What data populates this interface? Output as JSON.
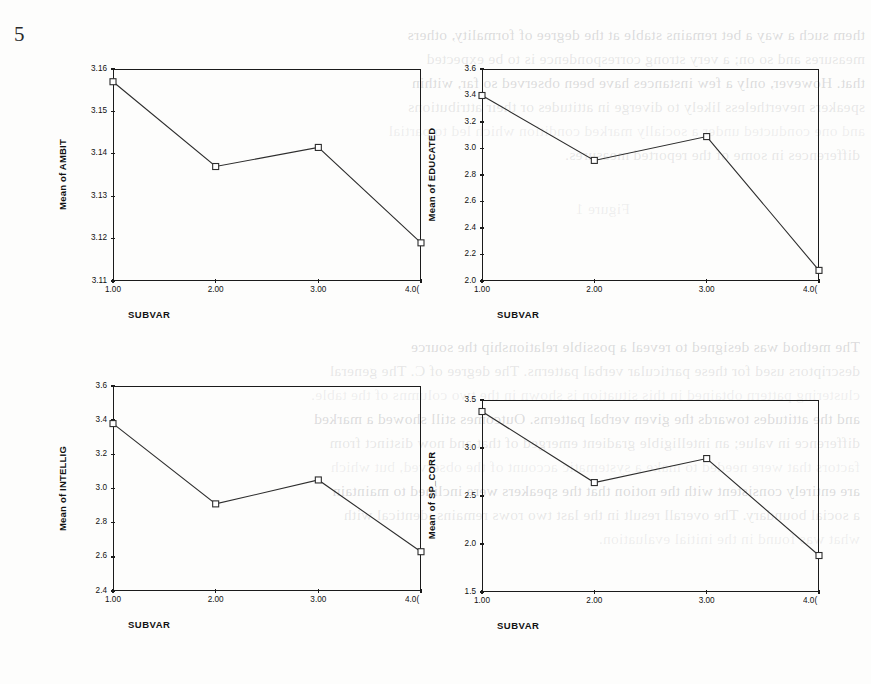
{
  "page": {
    "number": "5",
    "bleed_through_lines": [
      "them such a way a bet remains stable at the degree of formality, others",
      "measures and so on; a very strong correspondence is to be expected",
      "that. However, only a few instances have been observed so far, within",
      "speakers nevertheless likely to diverge in attitudes or their attributions",
      "and one conducted under a socially marked condition which led to partial",
      "differences in some of the reported measures.",
      "Figure 1",
      "The method was designed to reveal a possible relationship the source",
      "descriptors used for these particular verbal patterns. The degree of C. The general",
      "clustering pattern obtained in this situation is shown in the two columns of the table.",
      "and the attitudes towards the given verbal patterns. Outcomes still showed a marked",
      "difference in value; an intelligible gradient emerged of that and now distinct from",
      "factors that were needed to make a systematic account of the observed, but which",
      "are entirely consistent with the notion that the speakers were inclined to maintain",
      "a social boundary. The overall result in the last two rows remains identical with",
      "what was found in the initial evaluation."
    ]
  },
  "chart_data": [
    {
      "id": "ambit",
      "type": "line",
      "title": "",
      "ylabel": "Mean of AMBIT",
      "xlabel": "SUBVAR",
      "categories": [
        "1.00",
        "2.00",
        "3.00",
        "4.00"
      ],
      "x": [
        1,
        2,
        3,
        4
      ],
      "values": [
        3.157,
        3.137,
        3.1415,
        3.119
      ],
      "ylim": [
        3.11,
        3.16
      ],
      "ytick_values": [
        3.11,
        3.12,
        3.13,
        3.14,
        3.15,
        3.16
      ],
      "ytick_labels": [
        "3.11",
        "3.12",
        "3.13",
        "3.14",
        "3.15",
        "3.16"
      ],
      "xtick_labels": [
        "1.00",
        "2.00",
        "3.00",
        "4.0("
      ],
      "grid": false,
      "legend": "none",
      "marker": "open-square"
    },
    {
      "id": "educated",
      "type": "line",
      "title": "",
      "ylabel": "Mean of EDUCATED",
      "xlabel": "SUBVAR",
      "categories": [
        "1.00",
        "2.00",
        "3.00",
        "4.00"
      ],
      "x": [
        1,
        2,
        3,
        4
      ],
      "values": [
        3.4,
        2.91,
        3.09,
        2.08
      ],
      "ylim": [
        2.0,
        3.6
      ],
      "ytick_values": [
        2.0,
        2.2,
        2.4,
        2.6,
        2.8,
        3.0,
        3.2,
        3.4,
        3.6
      ],
      "ytick_labels": [
        "2.0",
        "2.2",
        "2.4",
        "2.6",
        "2.8",
        "3.0",
        "3.2",
        "3.4",
        "3.6"
      ],
      "xtick_labels": [
        "1.00",
        "2.00",
        "3.00",
        "4.0("
      ],
      "grid": false,
      "legend": "none",
      "marker": "open-square"
    },
    {
      "id": "intellig",
      "type": "line",
      "title": "",
      "ylabel": "Mean of INTELLIG",
      "xlabel": "SUBVAR",
      "categories": [
        "1.00",
        "2.00",
        "3.00",
        "4.00"
      ],
      "x": [
        1,
        2,
        3,
        4
      ],
      "values": [
        3.38,
        2.91,
        3.05,
        2.63
      ],
      "ylim": [
        2.4,
        3.6
      ],
      "ytick_values": [
        2.4,
        2.6,
        2.8,
        3.0,
        3.2,
        3.4,
        3.6
      ],
      "ytick_labels": [
        "2.4",
        "2.6",
        "2.8",
        "3.0",
        "3.2",
        "3.4",
        "3.6"
      ],
      "xtick_labels": [
        "1.00",
        "2.00",
        "3.00",
        "4.0("
      ],
      "grid": false,
      "legend": "none",
      "marker": "open-square"
    },
    {
      "id": "sp_corr",
      "type": "line",
      "title": "",
      "ylabel": "Mean of SP_CORR",
      "xlabel": "SUBVAR",
      "categories": [
        "1.00",
        "2.00",
        "3.00",
        "4.00"
      ],
      "x": [
        1,
        2,
        3,
        4
      ],
      "values": [
        3.38,
        2.64,
        2.89,
        1.88
      ],
      "ylim": [
        1.5,
        3.5
      ],
      "ytick_values": [
        1.5,
        2.0,
        2.5,
        3.0,
        3.5
      ],
      "ytick_labels": [
        "1.5",
        "2.0",
        "2.5",
        "3.0",
        "3.5"
      ],
      "xtick_labels": [
        "1.00",
        "2.00",
        "3.00",
        "4.0("
      ],
      "grid": false,
      "legend": "none",
      "marker": "open-square"
    }
  ],
  "layout": {
    "panels": [
      {
        "id": "ambit",
        "left": 18,
        "top": 60,
        "frame_left": 113,
        "frame_top": 69,
        "frame_w": 308,
        "frame_h": 212
      },
      {
        "id": "educated",
        "left": 440,
        "top": 60,
        "frame_left": 482,
        "frame_top": 69,
        "frame_w": 337,
        "frame_h": 212
      },
      {
        "id": "intellig",
        "left": 18,
        "top": 345,
        "frame_left": 113,
        "frame_top": 386,
        "frame_w": 308,
        "frame_h": 205
      },
      {
        "id": "sp_corr",
        "left": 440,
        "top": 345,
        "frame_left": 482,
        "frame_top": 400,
        "frame_w": 337,
        "frame_h": 192
      }
    ]
  },
  "colors": {
    "ink": "#1b1b1b",
    "line": "#2d2d2d",
    "paper": "#fdfdfc",
    "bleed": "rgba(140,140,145,0.30)"
  }
}
